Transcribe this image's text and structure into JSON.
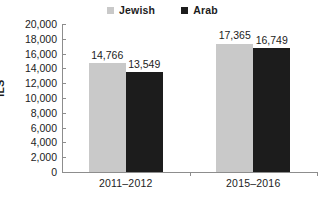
{
  "chart_data": {
    "type": "bar",
    "title": "",
    "subtitle": "",
    "xlabel": "",
    "ylabel": "ILS",
    "categories": [
      "2011–2012",
      "2015–2016"
    ],
    "series": [
      {
        "name": "Jewish",
        "color": "#c9c9c9",
        "values": [
          14766,
          16749
        ],
        "value_labels": [
          "14,766",
          "17,365"
        ]
      },
      {
        "name": "Arab",
        "color": "#1c1c1c",
        "values": [
          13549,
          16749
        ],
        "value_labels": [
          "13,549",
          "16,749"
        ]
      }
    ],
    "data_points": [
      {
        "category": "2011–2012",
        "series": "Jewish",
        "value": 14766,
        "label": "14,766"
      },
      {
        "category": "2011–2012",
        "series": "Arab",
        "value": 13549,
        "label": "13,549"
      },
      {
        "category": "2015–2016",
        "series": "Jewish",
        "value": 17365,
        "label": "17,365"
      },
      {
        "category": "2015–2016",
        "series": "Arab",
        "value": 16749,
        "label": "16,749"
      }
    ],
    "ylim": [
      0,
      20000
    ],
    "ytick_step": 2000,
    "ytick_labels": [
      "20,000",
      "18,000",
      "16,000",
      "14,000",
      "12,000",
      "10,000",
      "8,000",
      "6,000",
      "4,000",
      "2,000",
      "0"
    ],
    "ytick_values": [
      20000,
      18000,
      16000,
      14000,
      12000,
      10000,
      8000,
      6000,
      4000,
      2000,
      0
    ],
    "grid": false,
    "legend_position": "top-center",
    "legend": [
      {
        "label": "Jewish",
        "marker": "square",
        "color": "#c9c9c9"
      },
      {
        "label": "Arab",
        "marker": "square",
        "color": "#1c1c1c"
      }
    ]
  },
  "colors": {
    "background": "#ffffff",
    "axis": "#8d8d8d",
    "text": "#1c1c1c",
    "series_jewish": "#c9c9c9",
    "series_arab": "#1c1c1c"
  }
}
